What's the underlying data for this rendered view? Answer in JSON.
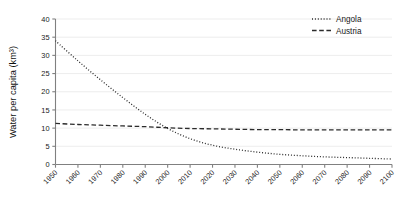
{
  "chart_data": {
    "type": "line",
    "title": "",
    "xlabel": "",
    "ylabel": "Water per capita (km³)",
    "xlim": [
      1950,
      2100
    ],
    "ylim": [
      0,
      40
    ],
    "ytick_step": 5,
    "grid": true,
    "grid_axis": "y",
    "legend_position": "top-right",
    "xticks": [
      "1950",
      "1960",
      "1970",
      "1980",
      "1990",
      "2000",
      "2010",
      "2020",
      "2030",
      "2040",
      "2050",
      "2060",
      "2070",
      "2080",
      "2090",
      "2100"
    ],
    "yticks": [
      "0",
      "5",
      "10",
      "15",
      "20",
      "25",
      "30",
      "35",
      "40"
    ],
    "x": [
      1950,
      1960,
      1970,
      1980,
      1990,
      2000,
      2010,
      2020,
      2030,
      2040,
      2050,
      2060,
      2070,
      2080,
      2090,
      2100
    ],
    "series": [
      {
        "name": "Angola",
        "style": "dotted",
        "color": "#2b2b2b",
        "values": [
          34.0,
          28.5,
          23.3,
          18.4,
          13.8,
          9.9,
          7.1,
          5.3,
          4.2,
          3.4,
          2.8,
          2.4,
          2.1,
          1.9,
          1.7,
          1.5
        ]
      },
      {
        "name": "Austria",
        "style": "dashed",
        "color": "#2b2b2b",
        "values": [
          11.3,
          11.0,
          10.8,
          10.6,
          10.4,
          10.1,
          9.9,
          9.8,
          9.7,
          9.6,
          9.6,
          9.5,
          9.5,
          9.5,
          9.5,
          9.5
        ]
      }
    ]
  },
  "legend": {
    "entries": [
      {
        "label": "Angola"
      },
      {
        "label": "Austria"
      }
    ]
  }
}
